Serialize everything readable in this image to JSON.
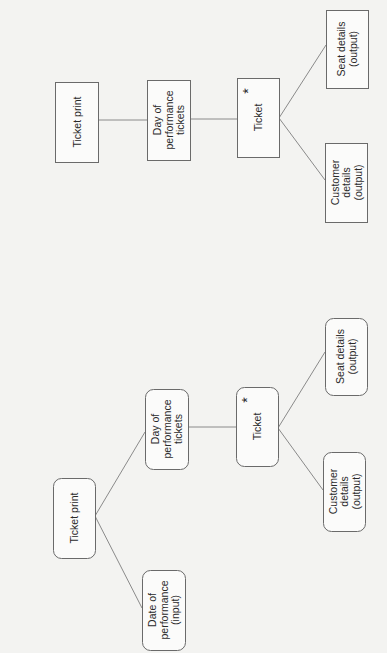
{
  "diagrams": [
    {
      "id": "physical-structure",
      "style": "rectangle",
      "nodes": [
        {
          "id": "ticket-print",
          "lines": [
            "Ticket print"
          ],
          "x": 55,
          "y": 82,
          "w": 43,
          "h": 80
        },
        {
          "id": "day-of-performance-tickets",
          "lines": [
            "Day of",
            "performance",
            "tickets"
          ],
          "x": 147,
          "y": 80,
          "w": 43,
          "h": 80
        },
        {
          "id": "ticket",
          "lines": [
            "Ticket"
          ],
          "x": 237,
          "y": 78,
          "w": 42,
          "h": 79,
          "iteration_marker": "*"
        },
        {
          "id": "seat-details",
          "lines": [
            "Seat details",
            "(output)"
          ],
          "x": 326,
          "y": 10,
          "w": 42,
          "h": 78
        },
        {
          "id": "customer-details",
          "lines": [
            "Customer",
            "details",
            "(output)"
          ],
          "x": 325,
          "y": 143,
          "w": 42,
          "h": 79
        }
      ],
      "edges": [
        {
          "from": "ticket-print",
          "to": "day-of-performance-tickets",
          "x1": 98,
          "y1": 120,
          "x2": 147,
          "y2": 120
        },
        {
          "from": "day-of-performance-tickets",
          "to": "ticket",
          "x1": 190,
          "y1": 119,
          "x2": 237,
          "y2": 119
        },
        {
          "from": "ticket",
          "to": "seat-details",
          "x1": 279,
          "y1": 118,
          "x2": 326,
          "y2": 45
        },
        {
          "from": "ticket",
          "to": "customer-details",
          "x1": 279,
          "y1": 118,
          "x2": 325,
          "y2": 180
        }
      ]
    },
    {
      "id": "logical-structure",
      "style": "rounded",
      "nodes": [
        {
          "id": "ticket-print",
          "lines": [
            "Ticket print"
          ],
          "x": 53,
          "y": 478,
          "w": 42,
          "h": 80
        },
        {
          "id": "date-of-performance",
          "lines": [
            "Date of",
            "performance",
            "(input)"
          ],
          "x": 142,
          "y": 570,
          "w": 43,
          "h": 80
        },
        {
          "id": "day-of-performance-tickets",
          "lines": [
            "Day of",
            "performance",
            "tickets"
          ],
          "x": 145,
          "y": 389,
          "w": 43,
          "h": 80
        },
        {
          "id": "ticket",
          "lines": [
            "Ticket"
          ],
          "x": 236,
          "y": 387,
          "w": 42,
          "h": 79,
          "iteration_marker": "*"
        },
        {
          "id": "seat-details",
          "lines": [
            "Seat details",
            "(output)"
          ],
          "x": 325,
          "y": 318,
          "w": 42,
          "h": 77
        },
        {
          "id": "customer-details",
          "lines": [
            "Customer",
            "details",
            "(output)"
          ],
          "x": 323,
          "y": 452,
          "w": 42,
          "h": 79
        }
      ],
      "edges": [
        {
          "from": "ticket-print",
          "to": "day-of-performance-tickets",
          "x1": 95,
          "y1": 516,
          "x2": 145,
          "y2": 432
        },
        {
          "from": "ticket-print",
          "to": "date-of-performance",
          "x1": 95,
          "y1": 516,
          "x2": 142,
          "y2": 608
        },
        {
          "from": "day-of-performance-tickets",
          "to": "ticket",
          "x1": 188,
          "y1": 427,
          "x2": 236,
          "y2": 427
        },
        {
          "from": "ticket",
          "to": "seat-details",
          "x1": 278,
          "y1": 428,
          "x2": 325,
          "y2": 352
        },
        {
          "from": "ticket",
          "to": "customer-details",
          "x1": 278,
          "y1": 428,
          "x2": 323,
          "y2": 490
        }
      ]
    }
  ]
}
